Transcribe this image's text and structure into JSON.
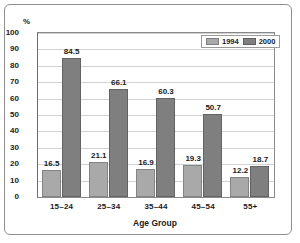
{
  "chart_data": {
    "type": "bar",
    "title": "",
    "subtitle": "",
    "xlabel": "Age Group",
    "ylabel": "%",
    "categories": [
      "15–24",
      "25–34",
      "35–44",
      "45–54",
      "55+"
    ],
    "series": [
      {
        "name": "1994",
        "color": "#a9a9a9",
        "values": [
          16.5,
          21.1,
          16.9,
          19.3,
          12.2
        ]
      },
      {
        "name": "2000",
        "color": "#7f7f7f",
        "values": [
          84.5,
          66.1,
          60.3,
          50.7,
          18.7
        ]
      }
    ],
    "ylim": [
      0,
      100
    ],
    "yticks": [
      "0",
      "10",
      "20",
      "30",
      "40",
      "50",
      "60",
      "70",
      "80",
      "90",
      "100"
    ],
    "grid": true,
    "legend_position": "top-right",
    "data_labels": true
  },
  "legend": {
    "items": [
      {
        "label": "1994"
      },
      {
        "label": "2000"
      }
    ]
  },
  "axis": {
    "y_unit_label": "%",
    "x_title": "Age Group"
  }
}
